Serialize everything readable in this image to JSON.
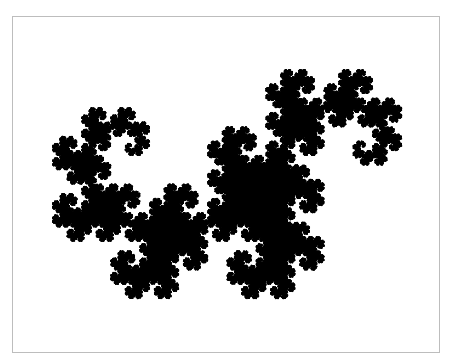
{
  "figure": {
    "title": "Heighway dragon curve fractal",
    "background": "#ffffff",
    "border_color": "#bdbdbd",
    "fill_color": "#000000"
  },
  "fractal": {
    "type": "heighway-dragon",
    "ifs": [
      {
        "a": 0.5,
        "b": -0.5,
        "c": 0.5,
        "d": 0.5,
        "e": 0,
        "f": 0
      },
      {
        "a": -0.5,
        "b": -0.5,
        "c": 0.5,
        "d": -0.5,
        "e": 1,
        "f": 0
      }
    ],
    "iterations": 400000,
    "flip_x": false,
    "flip_y": true,
    "bounds": {
      "x0": 52,
      "y0": 69,
      "x1": 401,
      "y1": 298
    }
  }
}
